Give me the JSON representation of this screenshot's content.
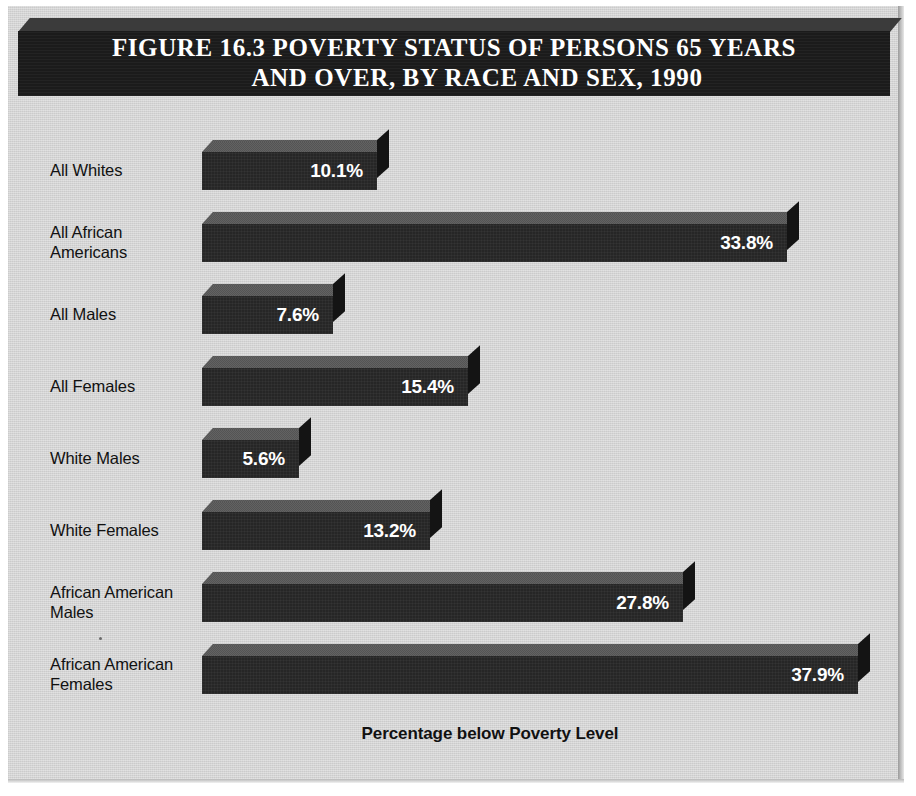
{
  "figure": {
    "title_line1": "FIGURE 16.3  POVERTY STATUS OF PERSONS 65 YEARS",
    "title_line2": "AND OVER, BY RACE AND SEX, 1990",
    "axis_caption": "Percentage below Poverty Level",
    "panel_color": "#d4d4d4",
    "banner_color": "#1b1b1b",
    "bar_color": "#262626",
    "bar_top_color": "#585858",
    "bar_side_color": "#141414",
    "value_text_color": "#ffffff",
    "label_text_color": "#111111"
  },
  "chart_data": {
    "type": "bar",
    "orientation": "horizontal",
    "title": "FIGURE 16.3  POVERTY STATUS OF PERSONS 65 YEARS AND OVER, BY RACE AND SEX, 1990",
    "xlabel": "Percentage below Poverty Level",
    "ylabel": "",
    "xlim": [
      0,
      40
    ],
    "grid": false,
    "legend": false,
    "categories": [
      "All Whites",
      "All African Americans",
      "All Males",
      "All Females",
      "White Males",
      "White Females",
      "African American Males",
      "African American Females"
    ],
    "values": [
      10.1,
      33.8,
      7.6,
      15.4,
      5.6,
      13.2,
      27.8,
      37.9
    ],
    "value_labels": [
      "10.1%",
      "33.8%",
      "7.6%",
      "15.4%",
      "5.6%",
      "13.2%",
      "27.8%",
      "37.9%"
    ]
  },
  "bars": [
    {
      "label_line1": "All Whites",
      "label_line2": "",
      "value": 10.1,
      "value_label": "10.1%"
    },
    {
      "label_line1": "All African",
      "label_line2": "Americans",
      "value": 33.8,
      "value_label": "33.8%"
    },
    {
      "label_line1": "All Males",
      "label_line2": "",
      "value": 7.6,
      "value_label": "7.6%"
    },
    {
      "label_line1": "All Females",
      "label_line2": "",
      "value": 15.4,
      "value_label": "15.4%"
    },
    {
      "label_line1": "White Males",
      "label_line2": "",
      "value": 5.6,
      "value_label": "5.6%"
    },
    {
      "label_line1": "White Females",
      "label_line2": "",
      "value": 13.2,
      "value_label": "13.2%"
    },
    {
      "label_line1": "African American",
      "label_line2": "Males",
      "value": 27.8,
      "value_label": "27.8%"
    },
    {
      "label_line1": "African American",
      "label_line2": "Females",
      "value": 37.9,
      "value_label": "37.9%"
    }
  ]
}
